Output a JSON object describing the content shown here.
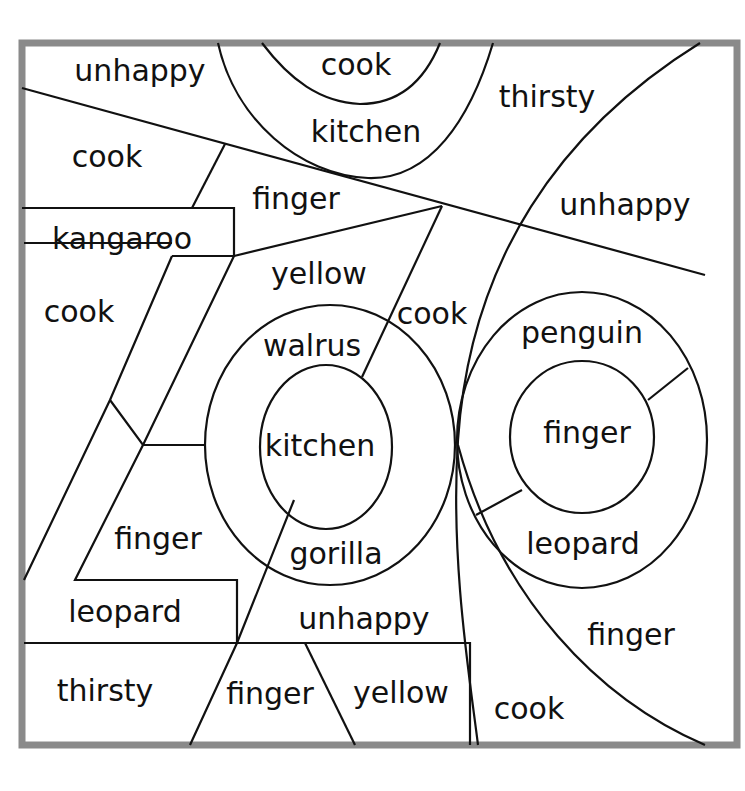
{
  "puzzle": {
    "frame_color": "#8a8a8a",
    "line_color": "#111111",
    "background": "#ffffff",
    "regions": [
      {
        "label": "unhappy",
        "x": 140,
        "y": 72
      },
      {
        "label": "cook",
        "x": 356,
        "y": 66
      },
      {
        "label": "kitchen",
        "x": 366,
        "y": 133
      },
      {
        "label": "thirsty",
        "x": 547,
        "y": 98
      },
      {
        "label": "cook",
        "x": 107,
        "y": 158
      },
      {
        "label": "finger",
        "x": 296,
        "y": 200
      },
      {
        "label": "unhappy",
        "x": 625,
        "y": 206
      },
      {
        "label": "kangaroo",
        "x": 122,
        "y": 240
      },
      {
        "label": "yellow",
        "x": 319,
        "y": 275
      },
      {
        "label": "cook",
        "x": 79,
        "y": 313
      },
      {
        "label": "cook",
        "x": 432,
        "y": 315
      },
      {
        "label": "walrus",
        "x": 312,
        "y": 347
      },
      {
        "label": "penguin",
        "x": 582,
        "y": 334
      },
      {
        "label": "kitchen",
        "x": 320,
        "y": 447
      },
      {
        "label": "finger",
        "x": 587,
        "y": 434
      },
      {
        "label": "finger",
        "x": 158,
        "y": 540
      },
      {
        "label": "gorilla",
        "x": 336,
        "y": 555
      },
      {
        "label": "leopard",
        "x": 583,
        "y": 545
      },
      {
        "label": "leopard",
        "x": 125,
        "y": 613
      },
      {
        "label": "unhappy",
        "x": 364,
        "y": 620
      },
      {
        "label": "finger",
        "x": 631,
        "y": 636
      },
      {
        "label": "thirsty",
        "x": 105,
        "y": 692
      },
      {
        "label": "finger",
        "x": 270,
        "y": 695
      },
      {
        "label": "yellow",
        "x": 401,
        "y": 694
      },
      {
        "label": "cook",
        "x": 529,
        "y": 710
      }
    ]
  }
}
